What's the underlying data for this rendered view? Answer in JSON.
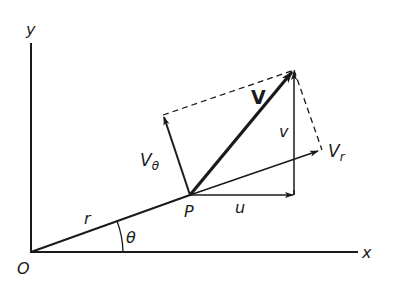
{
  "diagram": {
    "colors": {
      "ink": "#1a1a1a",
      "background": "#ffffff"
    },
    "labels": {
      "y_axis": "y",
      "x_axis": "x",
      "origin": "O",
      "radius": "r",
      "angle": "θ",
      "point": "P",
      "velocity": "V",
      "radial_component": "V",
      "radial_subscript": "r",
      "tangential_component": "V",
      "tangential_subscript": "θ",
      "horizontal_component": "u",
      "vertical_component": "v"
    },
    "elements": [
      "x-axis",
      "y-axis",
      "radius-line-O-to-P",
      "velocity-vector-V",
      "radial-vector-Vr",
      "tangential-vector-Vtheta",
      "horizontal-vector-u",
      "vertical-vector-v",
      "dashed-parallelogram-lines",
      "angle-arc-theta"
    ]
  }
}
